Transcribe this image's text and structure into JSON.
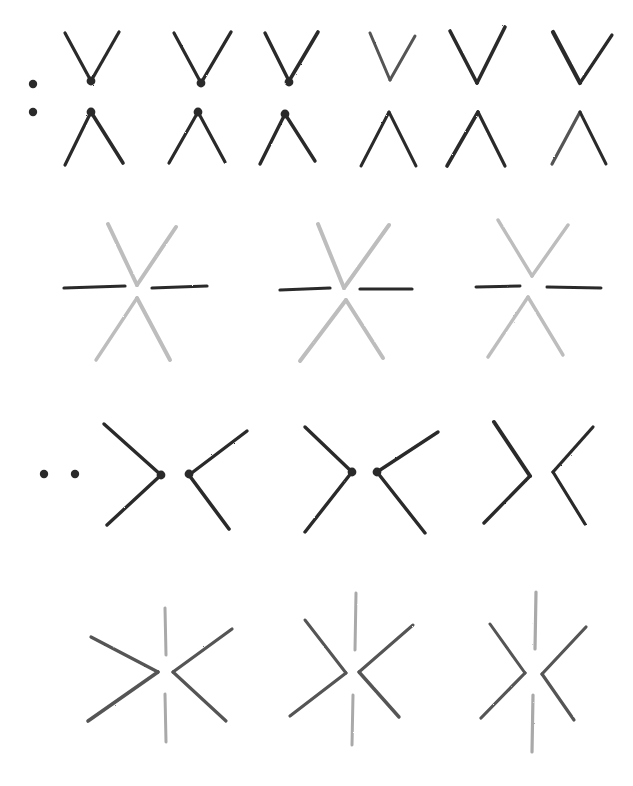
{
  "title": "Pencil stroke construction exercises",
  "colors": {
    "background": "#ffffff",
    "dark": "#2b2b2b",
    "mid": "#555555",
    "light": "#bdbdbd",
    "lighter": "#a9a9a9"
  },
  "rows": [
    {
      "name": "row-1-v-and-inverted-v",
      "dots": [
        [
          33,
          84
        ],
        [
          33,
          112
        ]
      ],
      "dot_color": "dark",
      "figures": [
        {
          "strokes": [
            [
              [
                65,
                33
              ],
              [
                91,
                81
              ],
              "dark",
              3.2
            ],
            [
              [
                91,
                81
              ],
              [
                119,
                32
              ],
              "dark",
              3.2
            ],
            [
              [
                65,
                165
              ],
              [
                91,
                112
              ],
              "dark",
              3.2
            ],
            [
              [
                91,
                112
              ],
              [
                123,
                163
              ],
              "dark",
              3.6
            ]
          ],
          "dots": [
            [
              91,
              81
            ],
            [
              91,
              112
            ]
          ]
        },
        {
          "strokes": [
            [
              [
                174,
                33
              ],
              [
                201,
                83
              ],
              "dark",
              3.2
            ],
            [
              [
                201,
                83
              ],
              [
                231,
                32
              ],
              "dark",
              3.4
            ],
            [
              [
                169,
                163
              ],
              [
                198,
                112
              ],
              "dark",
              3.2
            ],
            [
              [
                198,
                112
              ],
              [
                225,
                162
              ],
              "dark",
              3.2
            ]
          ],
          "dots": [
            [
              201,
              83
            ],
            [
              198,
              112
            ]
          ]
        },
        {
          "strokes": [
            [
              [
                265,
                33
              ],
              [
                289,
                81
              ],
              "dark",
              3.4
            ],
            [
              [
                289,
                81
              ],
              [
                318,
                32
              ],
              "dark",
              3.6
            ],
            [
              [
                260,
                164
              ],
              [
                285,
                114
              ],
              "dark",
              3.4
            ],
            [
              [
                285,
                114
              ],
              [
                315,
                161
              ],
              "dark",
              3.4
            ]
          ],
          "dots": [
            [
              289,
              82
            ],
            [
              285,
              114
            ]
          ]
        },
        {
          "strokes": [
            [
              [
                370,
                33
              ],
              [
                390,
                80
              ],
              "mid",
              3.0
            ],
            [
              [
                390,
                80
              ],
              [
                415,
                36
              ],
              "mid",
              3.0
            ],
            [
              [
                361,
                166
              ],
              [
                389,
                112
              ],
              "dark",
              3.0
            ],
            [
              [
                389,
                112
              ],
              [
                416,
                166
              ],
              "dark",
              3.0
            ]
          ],
          "dots": []
        },
        {
          "strokes": [
            [
              [
                450,
                31
              ],
              [
                477,
                83
              ],
              "dark",
              3.6
            ],
            [
              [
                477,
                83
              ],
              [
                505,
                27
              ],
              "dark",
              3.6
            ],
            [
              [
                447,
                166
              ],
              [
                478,
                112
              ],
              "dark",
              3.6
            ],
            [
              [
                478,
                112
              ],
              [
                505,
                166
              ],
              "dark",
              3.2
            ]
          ],
          "dots": []
        },
        {
          "strokes": [
            [
              [
                553,
                32
              ],
              [
                580,
                83
              ],
              "dark",
              4.2
            ],
            [
              [
                580,
                83
              ],
              [
                612,
                35
              ],
              "dark",
              3.2
            ],
            [
              [
                552,
                164
              ],
              [
                580,
                112
              ],
              "mid",
              3.2
            ],
            [
              [
                580,
                112
              ],
              [
                606,
                164
              ],
              "dark",
              3.0
            ]
          ],
          "dots": []
        }
      ]
    },
    {
      "name": "row-2-six-point-star",
      "figures": [
        {
          "strokes": [
            [
              [
                108,
                224
              ],
              [
                137,
                285
              ],
              "light",
              4.0
            ],
            [
              [
                137,
                285
              ],
              [
                176,
                227
              ],
              "light",
              4.0
            ],
            [
              [
                137,
                298
              ],
              [
                96,
                360
              ],
              "light",
              3.4
            ],
            [
              [
                137,
                298
              ],
              [
                170,
                360
              ],
              "light",
              4.0
            ],
            [
              [
                64,
                288
              ],
              [
                125,
                286
              ],
              "dark",
              3.2
            ],
            [
              [
                152,
                288
              ],
              [
                207,
                286
              ],
              "dark",
              3.2
            ]
          ]
        },
        {
          "strokes": [
            [
              [
                318,
                224
              ],
              [
                344,
                288
              ],
              "light",
              4.0
            ],
            [
              [
                344,
                288
              ],
              [
                389,
                225
              ],
              "light",
              4.0
            ],
            [
              [
                346,
                300
              ],
              [
                300,
                361
              ],
              "light",
              4.0
            ],
            [
              [
                346,
                300
              ],
              [
                383,
                358
              ],
              "light",
              4.0
            ],
            [
              [
                280,
                290
              ],
              [
                330,
                288
              ],
              "dark",
              3.2
            ],
            [
              [
                360,
                289
              ],
              [
                412,
                289
              ],
              "dark",
              3.2
            ]
          ]
        },
        {
          "strokes": [
            [
              [
                498,
                220
              ],
              [
                532,
                276
              ],
              "light",
              3.4
            ],
            [
              [
                532,
                276
              ],
              [
                568,
                225
              ],
              "light",
              3.4
            ],
            [
              [
                528,
                297
              ],
              [
                488,
                357
              ],
              "light",
              3.4
            ],
            [
              [
                528,
                297
              ],
              [
                563,
                355
              ],
              "light",
              3.4
            ],
            [
              [
                476,
                287
              ],
              [
                520,
                286
              ],
              "dark",
              3.0
            ],
            [
              [
                547,
                287
              ],
              [
                601,
                288
              ],
              "dark",
              3.0
            ]
          ]
        }
      ]
    },
    {
      "name": "row-3-opposing-chevrons",
      "dots": [
        [
          44,
          474
        ],
        [
          75,
          474
        ]
      ],
      "dot_color": "dark",
      "figures": [
        {
          "strokes": [
            [
              [
                104,
                424
              ],
              [
                161,
                475
              ],
              "dark",
              3.4
            ],
            [
              [
                161,
                475
              ],
              [
                107,
                525
              ],
              "dark",
              3.4
            ],
            [
              [
                189,
                475
              ],
              [
                247,
                431
              ],
              "dark",
              3.4
            ],
            [
              [
                189,
                475
              ],
              [
                229,
                529
              ],
              "dark",
              3.6
            ]
          ],
          "dots": [
            [
              161,
              475
            ],
            [
              189,
              474
            ]
          ]
        },
        {
          "strokes": [
            [
              [
                305,
                427
              ],
              [
                352,
                472
              ],
              "dark",
              3.4
            ],
            [
              [
                352,
                472
              ],
              [
                305,
                532
              ],
              "dark",
              3.4
            ],
            [
              [
                377,
                472
              ],
              [
                438,
                432
              ],
              "dark",
              3.4
            ],
            [
              [
                377,
                472
              ],
              [
                425,
                533
              ],
              "dark",
              3.4
            ]
          ],
          "dots": [
            [
              352,
              472
            ],
            [
              377,
              472
            ]
          ]
        },
        {
          "strokes": [
            [
              [
                494,
                422
              ],
              [
                530,
                476
              ],
              "dark",
              4.0
            ],
            [
              [
                530,
                476
              ],
              [
                484,
                523
              ],
              "dark",
              3.4
            ],
            [
              [
                553,
                472
              ],
              [
                593,
                427
              ],
              "dark",
              3.2
            ],
            [
              [
                553,
                472
              ],
              [
                585,
                524
              ],
              "dark",
              3.2
            ]
          ],
          "dots": []
        }
      ]
    },
    {
      "name": "row-4-chevrons-with-vertical-lines",
      "figures": [
        {
          "strokes": [
            [
              [
                91,
                637
              ],
              [
                158,
                672
              ],
              "mid",
              3.2
            ],
            [
              [
                158,
                672
              ],
              [
                88,
                721
              ],
              "mid",
              3.6
            ],
            [
              [
                173,
                672
              ],
              [
                232,
                629
              ],
              "mid",
              3.2
            ],
            [
              [
                173,
                672
              ],
              [
                226,
                721
              ],
              "mid",
              3.2
            ],
            [
              [
                165,
                608
              ],
              [
                166,
                655
              ],
              "lighter",
              3.0
            ],
            [
              [
                165,
                694
              ],
              [
                166,
                742
              ],
              "lighter",
              3.0
            ]
          ]
        },
        {
          "strokes": [
            [
              [
                305,
                620
              ],
              [
                346,
                673
              ],
              "mid",
              3.0
            ],
            [
              [
                346,
                673
              ],
              [
                290,
                716
              ],
              "mid",
              3.2
            ],
            [
              [
                359,
                672
              ],
              [
                413,
                625
              ],
              "mid",
              3.0
            ],
            [
              [
                359,
                672
              ],
              [
                399,
                717
              ],
              "mid",
              3.4
            ],
            [
              [
                356,
                593
              ],
              [
                355,
                650
              ],
              "lighter",
              3.0
            ],
            [
              [
                353,
                695
              ],
              [
                352,
                745
              ],
              "lighter",
              3.0
            ]
          ]
        },
        {
          "strokes": [
            [
              [
                490,
                624
              ],
              [
                525,
                673
              ],
              "mid",
              3.0
            ],
            [
              [
                525,
                673
              ],
              [
                481,
                718
              ],
              "mid",
              3.2
            ],
            [
              [
                542,
                674
              ],
              [
                586,
                627
              ],
              "mid",
              3.2
            ],
            [
              [
                542,
                674
              ],
              [
                574,
                720
              ],
              "mid",
              3.2
            ],
            [
              [
                536,
                592
              ],
              [
                535,
                649
              ],
              "lighter",
              3.2
            ],
            [
              [
                533,
                695
              ],
              [
                532,
                752
              ],
              "lighter",
              3.2
            ]
          ]
        }
      ]
    }
  ]
}
